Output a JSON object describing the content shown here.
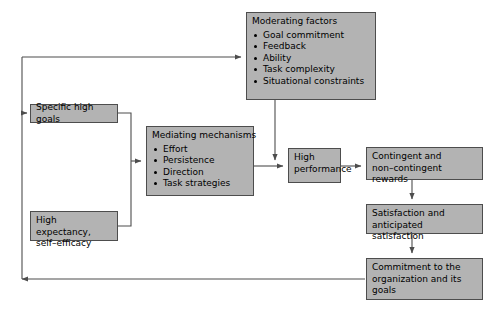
{
  "diagram": {
    "type": "flowchart",
    "palette": {
      "node_fill": "#b3b3b3",
      "node_border": "#4d4d4d",
      "edge": "#4d4d4d",
      "text": "#000000",
      "background": "#ffffff"
    },
    "nodes": {
      "moderating_factors": {
        "title": "Moderating factors",
        "items": [
          "Goal commitment",
          "Feedback",
          "Ability",
          "Task complexity",
          "Situational constraints"
        ]
      },
      "mediating_mechanisms": {
        "title": "Mediating mechanisms",
        "items": [
          "Effort",
          "Persistence",
          "Direction",
          "Task strategies"
        ]
      },
      "specific_high_goals": {
        "text": "Specific high goals"
      },
      "high_expectancy": {
        "text": "High expectancy,\nself–efficacy"
      },
      "high_performance": {
        "text": "High\nperformance"
      },
      "contingent_rewards": {
        "text": "Contingent and\nnon–contingent rewards"
      },
      "satisfaction": {
        "text": "Satisfaction and\nanticipated satisfaction"
      },
      "commitment": {
        "text": "Commitment to the\norganization and its\ngoals"
      }
    },
    "edges": [
      {
        "from": "specific_high_goals",
        "to": "mediating_mechanisms"
      },
      {
        "from": "high_expectancy",
        "to": "mediating_mechanisms"
      },
      {
        "from": "mediating_mechanisms",
        "to": "high_performance"
      },
      {
        "from": "moderating_factors",
        "to": "mediating_performance_link"
      },
      {
        "from": "high_performance",
        "to": "contingent_rewards"
      },
      {
        "from": "contingent_rewards",
        "to": "satisfaction"
      },
      {
        "from": "satisfaction",
        "to": "commitment"
      },
      {
        "from": "commitment",
        "to": "specific_high_goals"
      },
      {
        "from": "commitment",
        "to": "moderating_factors"
      }
    ]
  }
}
